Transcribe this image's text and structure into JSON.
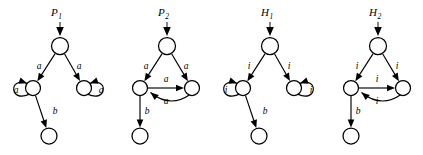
{
  "figure": {
    "type": "automata-diagram-set",
    "background": "#ffffff",
    "ink_color": "#000000",
    "count": 4
  },
  "automata": [
    {
      "id": "P1",
      "title": "P",
      "title_sub": "1",
      "shape": "branching",
      "states": [
        {
          "name": "q-top",
          "cx": 60,
          "cy": 46,
          "r": 8.5
        },
        {
          "name": "q-left",
          "cx": 33,
          "cy": 88,
          "r": 7.5
        },
        {
          "name": "q-right",
          "cx": 84,
          "cy": 88,
          "r": 7.5
        },
        {
          "name": "q-bottom",
          "cx": 49,
          "cy": 136,
          "r": 8.0
        }
      ],
      "start_arrow": {
        "x": 60,
        "y_from": 22,
        "y_to": 36
      },
      "transitions": [
        {
          "from": "q-top",
          "to": "q-left",
          "label": "a",
          "kind": "straight",
          "lx": 39,
          "ly": 69
        },
        {
          "from": "q-top",
          "to": "q-right",
          "label": "a",
          "kind": "straight",
          "lx": 79,
          "ly": 69
        },
        {
          "from": "q-left",
          "to": "q-left",
          "label": "a",
          "kind": "self-left",
          "lx": 16,
          "ly": 93
        },
        {
          "from": "q-right",
          "to": "q-right",
          "label": "a",
          "kind": "self-right",
          "lx": 101,
          "ly": 93
        },
        {
          "from": "q-left",
          "to": "q-bottom",
          "label": "b",
          "kind": "straight",
          "lx": 55,
          "ly": 114
        }
      ]
    },
    {
      "id": "P2",
      "title": "P",
      "title_sub": "2",
      "shape": "cyclic",
      "states": [
        {
          "name": "q-top",
          "cx": 167,
          "cy": 46,
          "r": 8.5
        },
        {
          "name": "q-left",
          "cx": 140,
          "cy": 88,
          "r": 7.5
        },
        {
          "name": "q-right",
          "cx": 192,
          "cy": 88,
          "r": 7.5
        },
        {
          "name": "q-bottom",
          "cx": 140,
          "cy": 136,
          "r": 8.0
        }
      ],
      "start_arrow": {
        "x": 167,
        "y_from": 22,
        "y_to": 36
      },
      "transitions": [
        {
          "from": "q-top",
          "to": "q-left",
          "label": "a",
          "kind": "straight",
          "lx": 146,
          "ly": 69
        },
        {
          "from": "q-top",
          "to": "q-right",
          "label": "a",
          "kind": "straight",
          "lx": 186,
          "ly": 69
        },
        {
          "from": "q-left",
          "to": "q-right",
          "label": "a",
          "kind": "straight-h",
          "lx": 166,
          "ly": 82
        },
        {
          "from": "q-right",
          "to": "q-left",
          "label": "a",
          "kind": "curve-back",
          "lx": 166,
          "ly": 104
        },
        {
          "from": "q-left",
          "to": "q-bottom",
          "label": "b",
          "kind": "straight",
          "lx": 147,
          "ly": 114
        }
      ]
    },
    {
      "id": "H1",
      "title": "H",
      "title_sub": "1",
      "shape": "branching",
      "states": [
        {
          "name": "q-top",
          "cx": 270,
          "cy": 46,
          "r": 8.5
        },
        {
          "name": "q-left",
          "cx": 243,
          "cy": 88,
          "r": 7.5
        },
        {
          "name": "q-right",
          "cx": 294,
          "cy": 88,
          "r": 7.5
        },
        {
          "name": "q-bottom",
          "cx": 259,
          "cy": 136,
          "r": 8.0
        }
      ],
      "start_arrow": {
        "x": 270,
        "y_from": 22,
        "y_to": 36
      },
      "transitions": [
        {
          "from": "q-top",
          "to": "q-left",
          "label": "i",
          "kind": "straight",
          "lx": 249,
          "ly": 69
        },
        {
          "from": "q-top",
          "to": "q-right",
          "label": "i",
          "kind": "straight",
          "lx": 289,
          "ly": 69
        },
        {
          "from": "q-left",
          "to": "q-left",
          "label": "i",
          "kind": "self-left",
          "lx": 226,
          "ly": 93
        },
        {
          "from": "q-right",
          "to": "q-right",
          "label": "i",
          "kind": "self-right",
          "lx": 311,
          "ly": 93
        },
        {
          "from": "q-left",
          "to": "q-bottom",
          "label": "b",
          "kind": "straight",
          "lx": 265,
          "ly": 114
        }
      ]
    },
    {
      "id": "H2",
      "title": "H",
      "title_sub": "2",
      "shape": "cyclic",
      "states": [
        {
          "name": "q-top",
          "cx": 378,
          "cy": 46,
          "r": 8.5
        },
        {
          "name": "q-left",
          "cx": 351,
          "cy": 88,
          "r": 7.5
        },
        {
          "name": "q-right",
          "cx": 403,
          "cy": 88,
          "r": 7.5
        },
        {
          "name": "q-bottom",
          "cx": 351,
          "cy": 136,
          "r": 8.0
        }
      ],
      "start_arrow": {
        "x": 378,
        "y_from": 22,
        "y_to": 36
      },
      "transitions": [
        {
          "from": "q-top",
          "to": "q-left",
          "label": "i",
          "kind": "straight",
          "lx": 357,
          "ly": 69
        },
        {
          "from": "q-top",
          "to": "q-right",
          "label": "i",
          "kind": "straight",
          "lx": 397,
          "ly": 69
        },
        {
          "from": "q-left",
          "to": "q-right",
          "label": "i",
          "kind": "straight-h",
          "lx": 377,
          "ly": 82
        },
        {
          "from": "q-right",
          "to": "q-left",
          "label": "i",
          "kind": "curve-back",
          "lx": 377,
          "ly": 104
        },
        {
          "from": "q-left",
          "to": "q-bottom",
          "label": "b",
          "kind": "straight",
          "lx": 358,
          "ly": 114
        }
      ]
    }
  ]
}
